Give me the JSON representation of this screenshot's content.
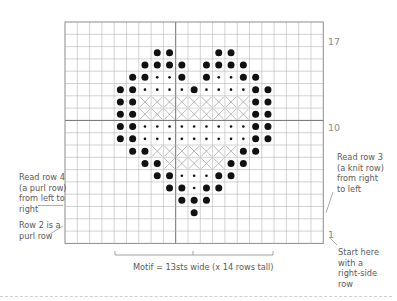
{
  "chart": {
    "grid": {
      "cols": 21,
      "rows": 18,
      "left": 65,
      "top": 22,
      "cell": 12.3,
      "major_col_line": 9,
      "major_row_line": 8,
      "line_color": "#b5b5b5",
      "major_line_color": "#6e6e6e",
      "border_color": "#8c8c8c"
    },
    "symbols": {
      "B": "large-dot (purl on RS)",
      "s": "small-dot",
      "X": "cross"
    },
    "cells": [
      {
        "row": 2,
        "B": [
          7,
          8,
          12,
          13
        ]
      },
      {
        "row": 3,
        "B": [
          6,
          7,
          8,
          9,
          11,
          12,
          13,
          14
        ]
      },
      {
        "row": 4,
        "B": [
          5,
          6,
          9,
          11,
          14,
          15
        ],
        "s": [
          7,
          8,
          12,
          13
        ]
      },
      {
        "row": 5,
        "B": [
          4,
          5,
          10,
          15,
          16
        ],
        "s": [
          6,
          7,
          8,
          9,
          11,
          12,
          13,
          14
        ]
      },
      {
        "row": 6,
        "B": [
          4,
          5,
          15,
          16
        ],
        "X": [
          6,
          7,
          8,
          9,
          10,
          11,
          12,
          13,
          14
        ]
      },
      {
        "row": 7,
        "B": [
          4,
          5,
          15,
          16
        ],
        "X": [
          6,
          7,
          8,
          9,
          10,
          11,
          12,
          13,
          14
        ]
      },
      {
        "row": 8,
        "B": [
          4,
          5,
          15,
          16
        ],
        "s": [
          6,
          7,
          8,
          9,
          10,
          11,
          12,
          13,
          14
        ]
      },
      {
        "row": 9,
        "B": [
          4,
          5,
          15,
          16
        ],
        "s": [
          6,
          7,
          8,
          9,
          10,
          11,
          12,
          13,
          14
        ]
      },
      {
        "row": 10,
        "B": [
          5,
          6,
          14,
          15
        ],
        "X": [
          7,
          8,
          9,
          10,
          11,
          12,
          13
        ]
      },
      {
        "row": 11,
        "B": [
          6,
          7,
          13,
          14
        ],
        "X": [
          8,
          9,
          10,
          11,
          12
        ]
      },
      {
        "row": 12,
        "B": [
          7,
          8,
          12,
          13
        ],
        "s": [
          9,
          10,
          11
        ]
      },
      {
        "row": 13,
        "B": [
          8,
          9,
          11,
          12
        ],
        "s": [
          10
        ]
      },
      {
        "row": 14,
        "B": [
          9,
          10,
          11
        ]
      },
      {
        "row": 15,
        "B": [
          10
        ]
      }
    ],
    "row_numbers": [
      {
        "label": "17",
        "x": 328,
        "y": 36
      },
      {
        "label": "10",
        "x": 328,
        "y": 122
      },
      {
        "label": "1",
        "x": 328,
        "y": 229
      }
    ],
    "motif_bracket": {
      "x1": 115,
      "x2": 273,
      "y": 255,
      "tick": 4,
      "center_x": 193
    }
  },
  "annotations": {
    "read_row_4": "Read row 4\n(a purl row)\nfrom left to\nright",
    "row_2": "Row 2 is a\npurl row",
    "read_row_3": "Read row 3\n(a knit row)\nfrom right\nto left",
    "start_here": "Start here\nwith a\nright-side\nrow",
    "motif_caption": "Motif = 13sts wide (x 14 rows tall)"
  }
}
